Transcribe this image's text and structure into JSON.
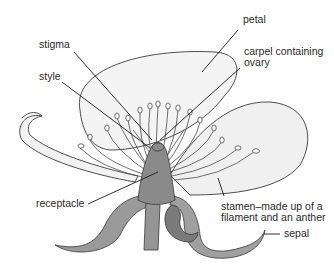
{
  "diagram": {
    "colors": {
      "petal_fill": "#f2f2f2",
      "petal_stroke": "#3a3a3a",
      "receptacle_fill": "#8f8f8f",
      "sepal_fill": "#9a9a9a",
      "stamen_stroke": "#4a4a4a",
      "leader_line": "#1a1a1a",
      "label_text": "#2a2a2a"
    },
    "labels": {
      "petal": "petal",
      "stigma": "stigma",
      "carpel": "carpel containing\novary",
      "style": "style",
      "receptacle": "receptacle",
      "stamen": "stamen–made up of a\nfilament and an anther",
      "sepal": "sepal"
    }
  }
}
